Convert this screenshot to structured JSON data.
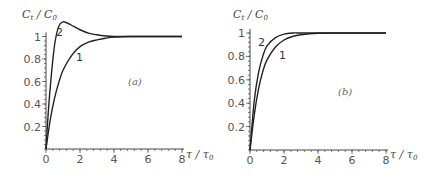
{
  "chart_data": [
    {
      "type": "line",
      "panel_label": "(a)",
      "ylabel": "C_t / C_0",
      "xlabel": "τ / τ_0",
      "xlim": [
        0,
        8
      ],
      "ylim": [
        0,
        1.15
      ],
      "xticks": [
        "0",
        "2",
        "4",
        "6",
        "8"
      ],
      "yticks": [
        "0.2",
        "0.4",
        "0.6",
        "0.8",
        "1"
      ],
      "grid": false,
      "series": [
        {
          "name": "1",
          "x": [
            0,
            0.25,
            0.5,
            0.75,
            1,
            1.5,
            2,
            2.5,
            3,
            3.5,
            4,
            5,
            6,
            8
          ],
          "y": [
            0,
            0.26,
            0.45,
            0.59,
            0.7,
            0.83,
            0.91,
            0.95,
            0.97,
            0.985,
            0.995,
            1,
            1,
            1
          ]
        },
        {
          "name": "2",
          "x": [
            0,
            0.1,
            0.25,
            0.5,
            0.75,
            1,
            1.25,
            1.5,
            2,
            2.5,
            3,
            3.5,
            4,
            5,
            6,
            8
          ],
          "y": [
            0,
            0.25,
            0.55,
            0.92,
            1.09,
            1.13,
            1.12,
            1.1,
            1.06,
            1.03,
            1.015,
            1.005,
            1.0,
            1,
            1,
            1
          ]
        }
      ]
    },
    {
      "type": "line",
      "panel_label": "(b)",
      "ylabel": "C_t / C_0",
      "xlabel": "τ / τ_0",
      "xlim": [
        0,
        8
      ],
      "ylim": [
        0,
        1.05
      ],
      "xticks": [
        "0",
        "2",
        "4",
        "6",
        "8"
      ],
      "yticks": [
        "0.2",
        "0.4",
        "0.6",
        "0.8",
        "1"
      ],
      "grid": false,
      "series": [
        {
          "name": "1",
          "x": [
            0,
            0.25,
            0.5,
            0.75,
            1,
            1.5,
            2,
            2.5,
            3,
            4,
            5,
            6,
            8
          ],
          "y": [
            0,
            0.3,
            0.52,
            0.67,
            0.77,
            0.88,
            0.94,
            0.97,
            0.985,
            0.998,
            1,
            1,
            1
          ]
        },
        {
          "name": "2",
          "x": [
            0,
            0.25,
            0.5,
            0.75,
            1,
            1.5,
            2,
            2.5,
            3,
            4,
            6,
            8
          ],
          "y": [
            0,
            0.42,
            0.66,
            0.8,
            0.89,
            0.96,
            0.99,
            1.0,
            1,
            1,
            1,
            1
          ]
        }
      ]
    }
  ],
  "labels": {
    "ylabel_main": "C",
    "ylabel_sub1": "t",
    "ylabel_mid": " / C",
    "ylabel_sub2": "0",
    "xlabel_main": "τ / τ",
    "xlabel_sub": "0",
    "panel_a": "(a)",
    "panel_b": "(b)",
    "curve1": "1",
    "curve2": "2"
  }
}
